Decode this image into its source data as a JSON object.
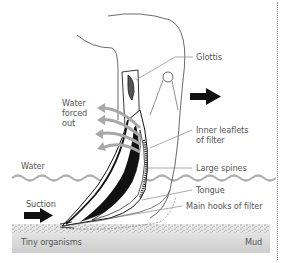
{
  "diagram": {
    "labels": {
      "glottis": "Glottis",
      "water_forced_out_1": "Water",
      "water_forced_out_2": "forced",
      "water_forced_out_3": "out",
      "inner_leaflets_1": "Inner leaflets",
      "inner_leaflets_2": "of filter",
      "water": "Water",
      "large_spines": "Large spines",
      "suction": "Suction",
      "tongue": "Tongue",
      "main_hooks": "Main hooks of filter",
      "tiny_organisms": "Tiny organisms",
      "mud": "Mud"
    },
    "colors": {
      "water_line": "#b0b0b0",
      "arrows_water": "#a8a8a8",
      "mud_top": "#dcdcdc",
      "mud_bottom": "#cfcfcf",
      "ink": "#111111",
      "label_text": "#555555",
      "leader_line": "#888888"
    }
  }
}
